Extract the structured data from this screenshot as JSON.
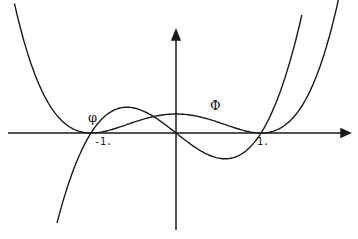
{
  "chart_data": {
    "type": "line",
    "title": "",
    "xlabel": "",
    "ylabel": "",
    "grid": false,
    "legend": "none (inline curve labels)",
    "axes": {
      "origin_px": [
        176,
        133
      ],
      "x_unit_px": 85,
      "x_axis_px": [
        8,
        350
      ],
      "y_axis_px": [
        230,
        30
      ],
      "x_tick_labels": [
        {
          "value": -1,
          "label": "-1."
        },
        {
          "value": 1,
          "label": "1."
        }
      ]
    },
    "series": [
      {
        "name": "φ",
        "description": "cubic with zeros at -1, 0, 1",
        "formula": "k*x*(x^2-1)",
        "k_px": 67,
        "x_range": [
          -1.4,
          1.48
        ],
        "label_px": [
          88,
          110
        ]
      },
      {
        "name": "Φ",
        "description": "quartic with double zeros at -1 and 1",
        "formula": "c*(x^2-1)^2",
        "c_px": 19,
        "x_range": [
          -1.9,
          1.92
        ],
        "label_px": [
          210,
          98
        ]
      }
    ],
    "colors": {
      "line": "#1a1a1a",
      "background": "#ffffff"
    }
  }
}
